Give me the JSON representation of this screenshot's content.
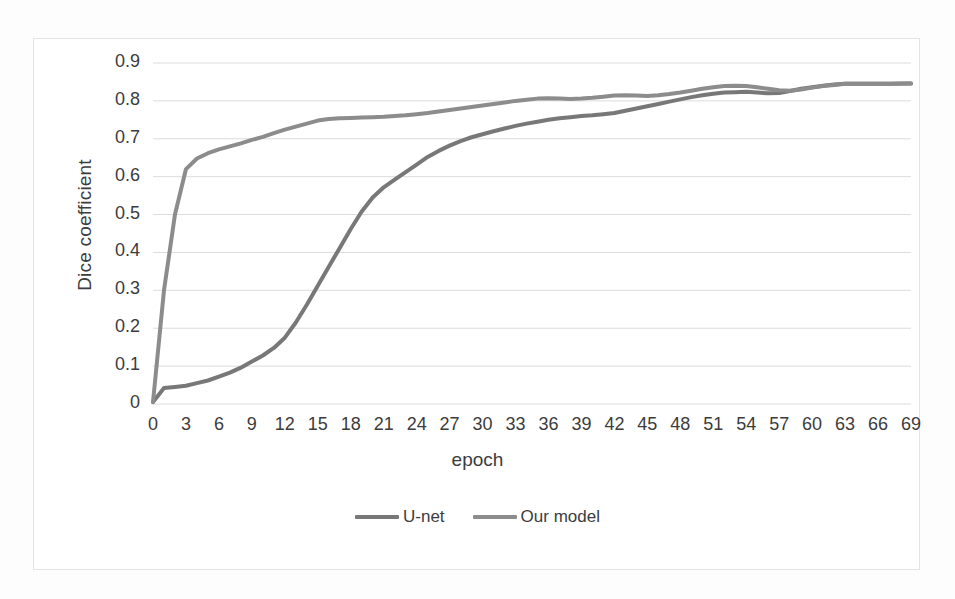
{
  "figure": {
    "background": "#fdfdfd",
    "frame_border_color": "#e4e4e4"
  },
  "chart_data": {
    "type": "line",
    "title": "",
    "xlabel": "epoch",
    "ylabel": "Dice coefficient",
    "xlim": [
      0,
      69
    ],
    "ylim": [
      0,
      0.9
    ],
    "grid": true,
    "grid_axis": "y",
    "legend_position": "bottom",
    "xticks": [
      0,
      3,
      6,
      9,
      12,
      15,
      18,
      21,
      24,
      27,
      30,
      33,
      36,
      39,
      42,
      45,
      48,
      51,
      54,
      57,
      60,
      63,
      66,
      69
    ],
    "xticklabels": [
      "0",
      "3",
      "6",
      "9",
      "12",
      "15",
      "18",
      "21",
      "24",
      "27",
      "30",
      "33",
      "36",
      "39",
      "42",
      "45",
      "48",
      "51",
      "54",
      "57",
      "60",
      "63",
      "66",
      "69"
    ],
    "yticks": [
      0,
      0.1,
      0.2,
      0.3,
      0.4,
      0.5,
      0.6,
      0.7,
      0.8,
      0.9
    ],
    "yticklabels": [
      "0",
      "0.1",
      "0.2",
      "0.3",
      "0.4",
      "0.5",
      "0.6",
      "0.7",
      "0.8",
      "0.9"
    ],
    "x": [
      0,
      1,
      2,
      3,
      4,
      5,
      6,
      7,
      8,
      9,
      10,
      11,
      12,
      13,
      14,
      15,
      16,
      17,
      18,
      19,
      20,
      21,
      22,
      23,
      24,
      25,
      26,
      27,
      28,
      29,
      30,
      31,
      32,
      33,
      34,
      35,
      36,
      37,
      38,
      39,
      40,
      41,
      42,
      43,
      44,
      45,
      46,
      47,
      48,
      49,
      50,
      51,
      52,
      53,
      54,
      55,
      56,
      57,
      58,
      59,
      60,
      61,
      62,
      63,
      64,
      65,
      66,
      67,
      68,
      69
    ],
    "series": [
      {
        "name": "U-net",
        "color": "#787878",
        "linewidth": 4,
        "values": [
          0.005,
          0.042,
          0.045,
          0.048,
          0.055,
          0.062,
          0.072,
          0.083,
          0.096,
          0.112,
          0.128,
          0.148,
          0.175,
          0.215,
          0.262,
          0.312,
          0.362,
          0.412,
          0.462,
          0.508,
          0.545,
          0.572,
          0.592,
          0.612,
          0.632,
          0.652,
          0.668,
          0.682,
          0.694,
          0.704,
          0.712,
          0.72,
          0.727,
          0.734,
          0.74,
          0.745,
          0.75,
          0.754,
          0.757,
          0.76,
          0.762,
          0.765,
          0.768,
          0.774,
          0.78,
          0.786,
          0.792,
          0.798,
          0.804,
          0.81,
          0.815,
          0.819,
          0.822,
          0.823,
          0.824,
          0.822,
          0.82,
          0.821,
          0.826,
          0.832,
          0.836,
          0.84,
          0.843,
          0.845,
          0.845,
          0.845,
          0.845,
          0.845,
          0.846,
          0.846
        ]
      },
      {
        "name": "Our model",
        "color": "#8c8c8c",
        "linewidth": 4,
        "values": [
          0.005,
          0.3,
          0.5,
          0.62,
          0.648,
          0.662,
          0.672,
          0.68,
          0.688,
          0.697,
          0.705,
          0.715,
          0.724,
          0.732,
          0.74,
          0.748,
          0.752,
          0.754,
          0.755,
          0.756,
          0.757,
          0.758,
          0.76,
          0.762,
          0.765,
          0.768,
          0.772,
          0.776,
          0.78,
          0.784,
          0.788,
          0.792,
          0.796,
          0.8,
          0.803,
          0.806,
          0.807,
          0.806,
          0.805,
          0.806,
          0.808,
          0.811,
          0.814,
          0.815,
          0.814,
          0.813,
          0.815,
          0.818,
          0.822,
          0.827,
          0.832,
          0.836,
          0.839,
          0.84,
          0.839,
          0.836,
          0.832,
          0.828,
          0.827,
          0.83,
          0.835,
          0.839,
          0.842,
          0.845,
          0.845,
          0.845,
          0.845,
          0.845,
          0.845,
          0.846
        ]
      }
    ]
  },
  "legend": {
    "entries": [
      {
        "label": "U-net",
        "color": "#787878"
      },
      {
        "label": "Our model",
        "color": "#8c8c8c"
      }
    ]
  }
}
